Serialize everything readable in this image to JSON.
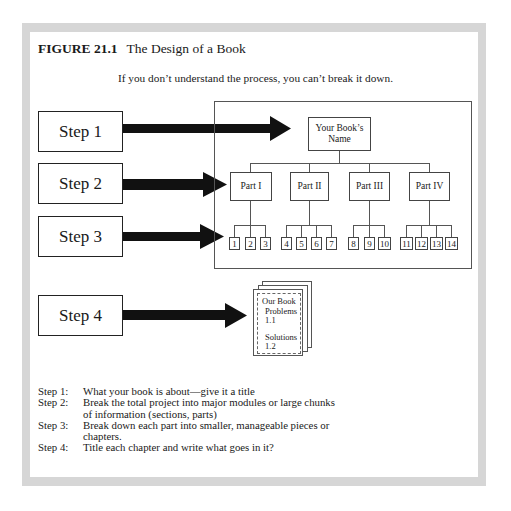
{
  "figure": {
    "number": "FIGURE 21.1",
    "title": "The Design of a Book",
    "subtitle": "If you don’t understand the process, you can’t break it down."
  },
  "steps": [
    {
      "label": "Step 1"
    },
    {
      "label": "Step 2"
    },
    {
      "label": "Step 3"
    },
    {
      "label": "Step 4"
    }
  ],
  "hierarchy": {
    "root": {
      "line1": "Your Book’s",
      "line2": "Name"
    },
    "parts": [
      {
        "label": "Part I",
        "chapters": [
          "1",
          "2",
          "3"
        ]
      },
      {
        "label": "Part II",
        "chapters": [
          "4",
          "5",
          "6",
          "7"
        ]
      },
      {
        "label": "Part III",
        "chapters": [
          "8",
          "9",
          "10"
        ]
      },
      {
        "label": "Part IV",
        "chapters": [
          "11",
          "12",
          "13",
          "14"
        ]
      }
    ]
  },
  "chapter_page": {
    "line1": "Our Book",
    "line2": "Problems",
    "line3": "1.1",
    "line4": "Solutions",
    "line5": "1.2"
  },
  "legend": [
    {
      "key": "Step 1:",
      "text": "What your book is about—give it a title"
    },
    {
      "key": "Step 2:",
      "text": "Break the total project into major modules or large chunks of information (sections, parts)"
    },
    {
      "key": "Step 3:",
      "text": "Break down each part into smaller, manageable pieces or chapters."
    },
    {
      "key": "Step 4:",
      "text": "Title each chapter and write what goes in it?"
    }
  ],
  "colors": {
    "frame": "#d6d6d6",
    "arrow": "#111111",
    "box_border": "#222222"
  }
}
